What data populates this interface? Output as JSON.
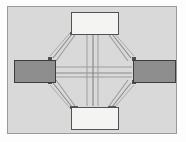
{
  "figure": {
    "canvas": {
      "background_color": "#d9d9d9",
      "border_color": "#9a9a9a",
      "outer_margin_color": "#ffffff",
      "width": 186,
      "height": 142
    },
    "colors": {
      "light_node_fill": "#f4f4f2",
      "light_node_border": "#525252",
      "dark_node_fill": "#8e8e8e",
      "dark_node_border": "#3d3d3d",
      "link_stroke": "#8a8a8a",
      "link_stroke_dark": "#6f6f6f",
      "port_color": "#4f4f4f"
    },
    "nodes": [
      {
        "id": "node-top",
        "label": "",
        "style": "light",
        "x": 63,
        "y": 5,
        "width": 48,
        "height": 23
      },
      {
        "id": "node-left",
        "label": "",
        "style": "dark",
        "x": 6,
        "y": 53,
        "width": 42,
        "height": 23
      },
      {
        "id": "node-right",
        "label": "",
        "style": "dark",
        "x": 125,
        "y": 53,
        "width": 43,
        "height": 23
      },
      {
        "id": "node-bottom",
        "label": "",
        "style": "light",
        "x": 63,
        "y": 100,
        "width": 48,
        "height": 23
      }
    ],
    "links": [
      {
        "id": "link-top-left",
        "from": "node-top",
        "to": "node-left"
      },
      {
        "id": "link-top-right",
        "from": "node-top",
        "to": "node-right"
      },
      {
        "id": "link-bottom-left",
        "from": "node-bottom",
        "to": "node-left"
      },
      {
        "id": "link-bottom-right",
        "from": "node-bottom",
        "to": "node-right"
      },
      {
        "id": "link-left-right",
        "from": "node-left",
        "to": "node-right"
      },
      {
        "id": "link-top-bottom",
        "from": "node-top",
        "to": "node-bottom"
      }
    ],
    "link_count": 6,
    "node_count": 4
  }
}
